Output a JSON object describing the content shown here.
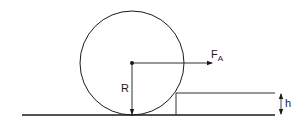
{
  "diagram": {
    "type": "physics-free-body",
    "labels": {
      "force": "F",
      "force_subscript": "A",
      "radius": "R",
      "step_height": "h"
    },
    "elements": {
      "wheel": {
        "cx": 132,
        "cy": 63,
        "r": 52
      },
      "ground": {
        "x1": 22,
        "x2": 275,
        "y": 115
      },
      "step": {
        "x_left": 176,
        "x_right": 275,
        "y_top": 93
      },
      "force_arrow": {
        "x1": 132,
        "y1": 63,
        "x2": 212,
        "y2": 63
      },
      "radius_arrow": {
        "x": 132,
        "y1": 63,
        "y2": 115
      },
      "height_arrow": {
        "x": 281,
        "y1": 93,
        "y2": 115
      }
    },
    "colors": {
      "stroke": "#1a1a1a",
      "background": "#ffffff"
    }
  }
}
